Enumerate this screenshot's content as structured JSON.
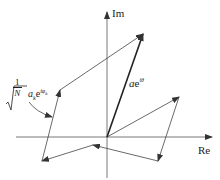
{
  "diagram": {
    "axes": {
      "x_label": "Re",
      "y_label": "Im",
      "origin": [
        107,
        137
      ]
    },
    "resultant": {
      "label_prefix": "a",
      "label_base": "e",
      "label_exp": "iθ",
      "from": [
        107,
        137
      ],
      "to": [
        143,
        34
      ]
    },
    "phasor_chain": {
      "points": [
        [
          107,
          137
        ],
        [
          179,
          97
        ],
        [
          158,
          161
        ],
        [
          93,
          145
        ],
        [
          42,
          161
        ],
        [
          60,
          90
        ],
        [
          143,
          34
        ]
      ]
    },
    "annotation": {
      "numerator": "1",
      "denominator": "N",
      "term_prefix": "a",
      "term_sub": "k",
      "term_base": "e",
      "term_exp": "iφ",
      "term_exp_sub": "k"
    },
    "colors": {
      "line": "#333333",
      "background": "#ffffff"
    }
  }
}
